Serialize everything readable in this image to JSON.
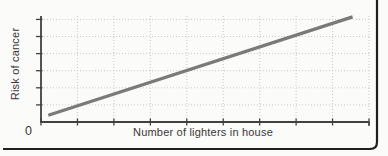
{
  "chart_data": {
    "type": "line",
    "title": "",
    "xlabel": "Number of lighters in house",
    "ylabel": "Risk of cancer",
    "origin_tick_label": "0",
    "x_ticks": [
      0,
      1,
      2,
      3,
      4,
      5,
      6,
      7,
      8,
      9
    ],
    "y_ticks": [
      1,
      2,
      3,
      4,
      5,
      6
    ],
    "xlim": [
      0,
      9
    ],
    "ylim": [
      0,
      6.2
    ],
    "grid": "dotted",
    "axis_tick_labels_visible": false,
    "legend": "none",
    "series": [
      {
        "name": "cancer-risk-vs-lighters",
        "x": [
          0.2,
          8.55
        ],
        "y": [
          0.4,
          6.15
        ]
      }
    ],
    "colors": {
      "line": "#7a7a7a",
      "grid": "#c6cbc6",
      "axis": "#414141",
      "frame": "#1f1f1f",
      "text": "#383838",
      "background": "#fbfbf9"
    }
  }
}
